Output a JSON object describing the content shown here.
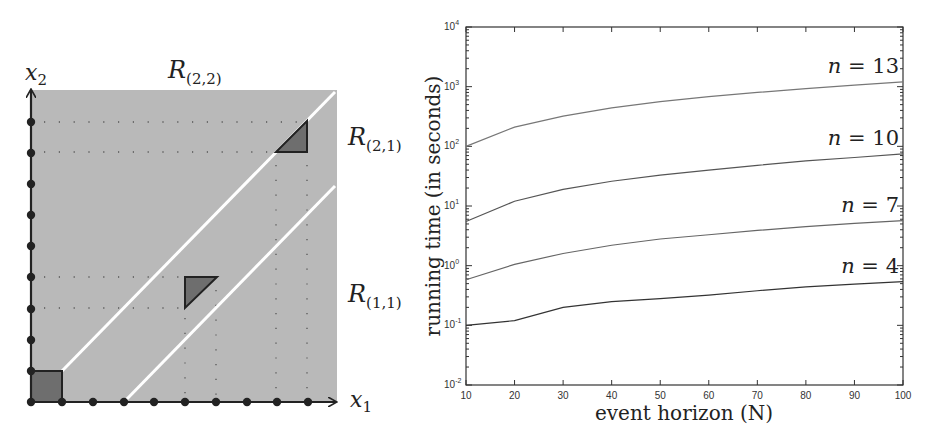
{
  "left_diagram": {
    "x_axis_label": "x",
    "x_axis_sub": "1",
    "y_axis_label": "x",
    "y_axis_sub": "2",
    "regions": [
      {
        "label": "R",
        "sub": "(2,2)"
      },
      {
        "label": "R",
        "sub": "(2,1)"
      },
      {
        "label": "R",
        "sub": "(1,1)"
      }
    ],
    "colors": {
      "region_fill": "#b9b9b9",
      "shape_fill": "#6e6e6e",
      "diagonal": "#ffffff",
      "axis": "#222222"
    }
  },
  "chart_data": {
    "type": "line",
    "title": "",
    "xlabel": "event horizon (N)",
    "ylabel": "running time (in seconds)",
    "yscale": "log",
    "xlim": [
      10,
      100
    ],
    "ylim": [
      0.01,
      10000
    ],
    "x": [
      10,
      20,
      30,
      40,
      50,
      60,
      70,
      80,
      90,
      100
    ],
    "x_tick_labels": [
      "10",
      "20",
      "30",
      "40",
      "50",
      "60",
      "70",
      "80",
      "90",
      "100"
    ],
    "y_tick_labels": [
      {
        "base": "10",
        "exp": "-2"
      },
      {
        "base": "10",
        "exp": "-1"
      },
      {
        "base": "10",
        "exp": "0"
      },
      {
        "base": "10",
        "exp": "1"
      },
      {
        "base": "10",
        "exp": "2"
      },
      {
        "base": "10",
        "exp": "3"
      },
      {
        "base": "10",
        "exp": "4"
      }
    ],
    "grid": false,
    "legend": "inline labels at right end of each line",
    "series": [
      {
        "name": "n = 13",
        "values": [
          100,
          210,
          320,
          440,
          560,
          680,
          800,
          930,
          1060,
          1200
        ]
      },
      {
        "name": "n = 10",
        "values": [
          5.5,
          12,
          19,
          26,
          33,
          40,
          48,
          57,
          65,
          75
        ]
      },
      {
        "name": "n = 7",
        "values": [
          0.58,
          1.05,
          1.6,
          2.2,
          2.8,
          3.3,
          3.9,
          4.5,
          5.1,
          5.7
        ]
      },
      {
        "name": "n = 4",
        "values": [
          0.1,
          0.12,
          0.2,
          0.25,
          0.28,
          0.32,
          0.38,
          0.44,
          0.49,
          0.54
        ]
      }
    ]
  }
}
